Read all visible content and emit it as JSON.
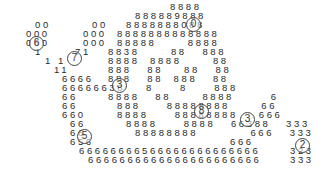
{
  "rows": [
    {
      "x": 170,
      "y": 2,
      "text": "8888"
    },
    {
      "x": 135,
      "y": 11,
      "text": "888889888"
    },
    {
      "x": 126,
      "y": 20,
      "text": "8888888088"
    },
    {
      "x": 35,
      "y": 20,
      "text": "00"
    },
    {
      "x": 92,
      "y": 20,
      "text": "00"
    },
    {
      "x": 117,
      "y": 29,
      "text": "8888888888888"
    },
    {
      "x": 26,
      "y": 29,
      "text": "000"
    },
    {
      "x": 83,
      "y": 29,
      "text": "000"
    },
    {
      "x": 117,
      "y": 38,
      "text": "88888      8888"
    },
    {
      "x": 26,
      "y": 38,
      "text": "000"
    },
    {
      "x": 83,
      "y": 38,
      "text": "000"
    },
    {
      "x": 108,
      "y": 47,
      "text": "8838      88   888"
    },
    {
      "x": 35,
      "y": 47,
      "text": "1"
    },
    {
      "x": 75,
      "y": 47,
      "text": "71"
    },
    {
      "x": 108,
      "y": 56,
      "text": "8888  8888      88"
    },
    {
      "x": 45,
      "y": 56,
      "text": "1 1"
    },
    {
      "x": 108,
      "y": 65,
      "text": "888   88    88   88"
    },
    {
      "x": 54,
      "y": 65,
      "text": "11"
    },
    {
      "x": 108,
      "y": 74,
      "text": "888   88  888   88"
    },
    {
      "x": 62,
      "y": 74,
      "text": "6666"
    },
    {
      "x": 62,
      "y": 83,
      "text": "66666638    8     8     888"
    },
    {
      "x": 62,
      "y": 92,
      "text": "66"
    },
    {
      "x": 108,
      "y": 92,
      "text": "8888   88      8888       6"
    },
    {
      "x": 62,
      "y": 101,
      "text": "66"
    },
    {
      "x": 117,
      "y": 101,
      "text": "888     88888888      66"
    },
    {
      "x": 62,
      "y": 110,
      "text": "660"
    },
    {
      "x": 117,
      "y": 110,
      "text": "8888     88888888    666"
    },
    {
      "x": 70,
      "y": 119,
      "text": "66"
    },
    {
      "x": 126,
      "y": 119,
      "text": "8888     8888   66388   333"
    },
    {
      "x": 70,
      "y": 128,
      "text": "66"
    },
    {
      "x": 135,
      "y": 128,
      "text": "88888888          666   333"
    },
    {
      "x": 70,
      "y": 137,
      "text": "656"
    },
    {
      "x": 230,
      "y": 137,
      "text": "666"
    },
    {
      "x": 79,
      "y": 146,
      "text": "66666666566666666666666"
    },
    {
      "x": 290,
      "y": 146,
      "text": "323"
    },
    {
      "x": 88,
      "y": 155,
      "text": "6666666666666666666666"
    },
    {
      "x": 290,
      "y": 155,
      "text": "333"
    }
  ],
  "badges": [
    {
      "label": "6",
      "x": 29,
      "y": 36
    },
    {
      "label": "7",
      "x": 67,
      "y": 51
    },
    {
      "label": "0",
      "x": 186,
      "y": 17
    },
    {
      "label": "3",
      "x": 112,
      "y": 78
    },
    {
      "label": "8",
      "x": 194,
      "y": 104
    },
    {
      "label": "3",
      "x": 240,
      "y": 112
    },
    {
      "label": "5",
      "x": 77,
      "y": 129
    },
    {
      "label": "2",
      "x": 295,
      "y": 138
    }
  ]
}
